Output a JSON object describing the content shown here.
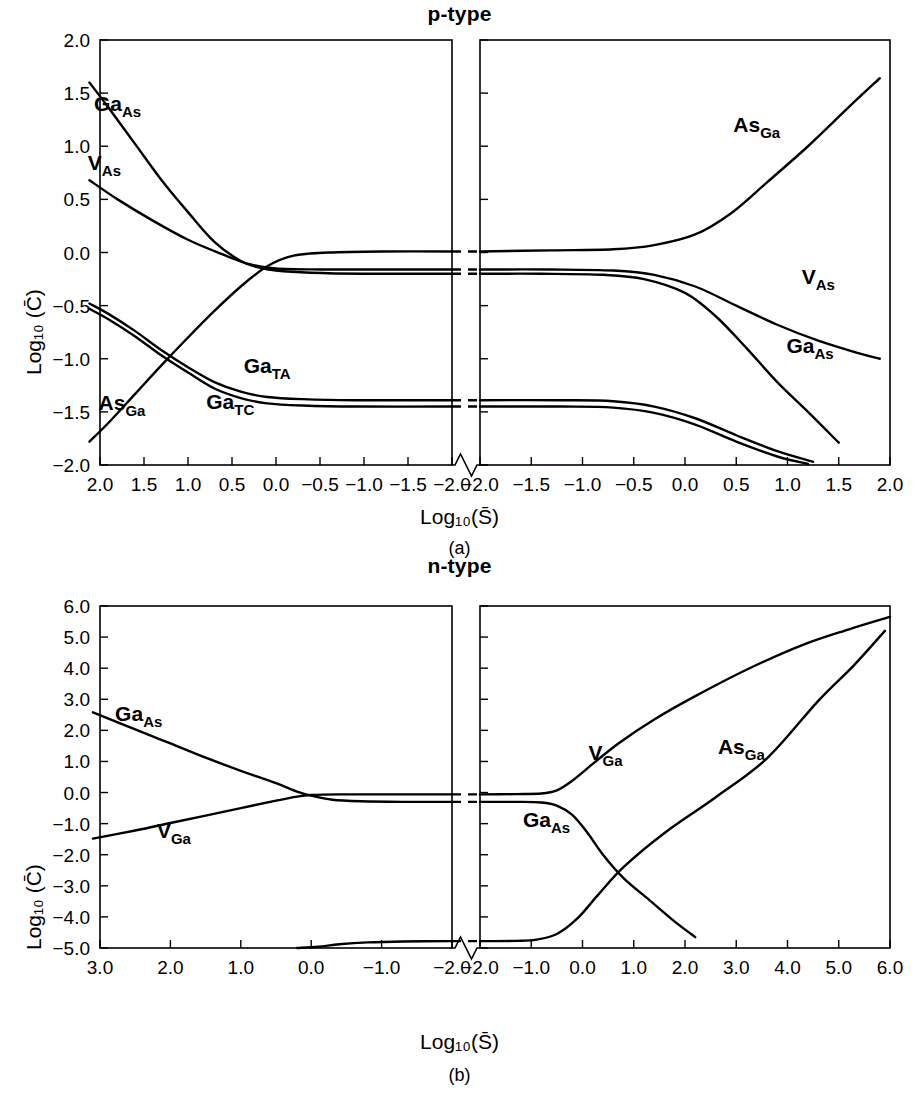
{
  "figure": {
    "panels": [
      {
        "id": "a",
        "title": "p-type",
        "caption": "(a)",
        "xlabel": "Log₁₀(S̄)",
        "ylabel": "Log₁₀ (C̄)"
      },
      {
        "id": "b",
        "title": "n-type",
        "caption": "(b)",
        "xlabel": "Log₁₀(S̄)",
        "ylabel": "Log₁₀ (C̄)"
      }
    ]
  },
  "chart_data": [
    {
      "type": "line",
      "title": "p-type",
      "caption": "(a)",
      "xlabel": "Log10(S-bar)",
      "ylabel": "Log10 (C-bar)",
      "grid": false,
      "legend": "inline-curve-labels",
      "axis_break": true,
      "left_panel": {
        "xlim": [
          2.0,
          -2.0
        ],
        "xticks": [
          2.0,
          1.5,
          1.0,
          0.5,
          0.0,
          -0.5,
          -1.0,
          -1.5,
          -2.0
        ],
        "xticklabels": [
          "2.0",
          "1.5",
          "1.0",
          "0.5",
          "0.0",
          "−0.5",
          "−1.0",
          "−1.5",
          "−2.0"
        ]
      },
      "right_panel": {
        "xlim": [
          -2.0,
          2.0
        ],
        "xticks": [
          -2.0,
          -1.5,
          -1.0,
          -0.5,
          0.0,
          0.5,
          1.0,
          1.5,
          2.0
        ],
        "xticklabels": [
          "−2.0",
          "−1.5",
          "−1.0",
          "−0.5",
          "0.0",
          "0.5",
          "1.0",
          "1.5",
          "2.0"
        ]
      },
      "ylim": [
        -2.0,
        2.0
      ],
      "yticks": [
        2.0,
        1.5,
        1.0,
        0.5,
        0.0,
        -0.5,
        -1.0,
        -1.5,
        -2.0
      ],
      "yticklabels": [
        "2.0",
        "1.5",
        "1.0",
        "0.5",
        "0.0",
        "−0.5",
        "−1.0",
        "−1.5",
        "−2.0"
      ],
      "series": [
        {
          "name": "Ga_As",
          "label_base": "Ga",
          "label_sub": "As",
          "left_points": [
            [
              2.12,
              1.6
            ],
            [
              1.9,
              1.36
            ],
            [
              1.6,
              1.02
            ],
            [
              1.3,
              0.68
            ],
            [
              1.0,
              0.38
            ],
            [
              0.7,
              0.1
            ],
            [
              0.4,
              -0.08
            ],
            [
              0.2,
              -0.14
            ],
            [
              0.0,
              -0.17
            ],
            [
              -0.4,
              -0.19
            ],
            [
              -1.0,
              -0.2
            ],
            [
              -1.6,
              -0.2
            ],
            [
              -2.0,
              -0.2
            ]
          ],
          "right_points": [
            [
              -2.0,
              -0.2
            ],
            [
              -1.4,
              -0.2
            ],
            [
              -0.8,
              -0.21
            ],
            [
              -0.4,
              -0.25
            ],
            [
              0.0,
              -0.38
            ],
            [
              0.3,
              -0.6
            ],
            [
              0.6,
              -0.9
            ],
            [
              0.9,
              -1.22
            ],
            [
              1.2,
              -1.5
            ],
            [
              1.5,
              -1.79
            ]
          ]
        },
        {
          "name": "V_As",
          "label_base": "V",
          "label_sub": "As",
          "left_points": [
            [
              2.12,
              0.68
            ],
            [
              1.8,
              0.5
            ],
            [
              1.4,
              0.3
            ],
            [
              1.0,
              0.12
            ],
            [
              0.6,
              -0.02
            ],
            [
              0.3,
              -0.11
            ],
            [
              0.0,
              -0.15
            ],
            [
              -0.5,
              -0.16
            ],
            [
              -1.1,
              -0.16
            ],
            [
              -1.6,
              -0.16
            ],
            [
              -2.0,
              -0.16
            ]
          ],
          "right_points": [
            [
              -2.0,
              -0.16
            ],
            [
              -1.3,
              -0.16
            ],
            [
              -0.7,
              -0.17
            ],
            [
              -0.3,
              -0.21
            ],
            [
              0.1,
              -0.32
            ],
            [
              0.5,
              -0.5
            ],
            [
              0.9,
              -0.68
            ],
            [
              1.3,
              -0.83
            ],
            [
              1.7,
              -0.95
            ],
            [
              1.9,
              -1.0
            ]
          ]
        },
        {
          "name": "As_Ga",
          "label_base": "As",
          "label_sub": "Ga",
          "left_points": [
            [
              2.12,
              -1.78
            ],
            [
              1.9,
              -1.6
            ],
            [
              1.6,
              -1.33
            ],
            [
              1.3,
              -1.06
            ],
            [
              1.0,
              -0.8
            ],
            [
              0.7,
              -0.55
            ],
            [
              0.4,
              -0.32
            ],
            [
              0.1,
              -0.13
            ],
            [
              -0.2,
              -0.03
            ],
            [
              -0.6,
              0.0
            ],
            [
              -1.2,
              0.01
            ],
            [
              -2.0,
              0.01
            ]
          ],
          "right_points": [
            [
              -2.0,
              0.01
            ],
            [
              -1.3,
              0.02
            ],
            [
              -0.7,
              0.03
            ],
            [
              -0.3,
              0.07
            ],
            [
              0.1,
              0.17
            ],
            [
              0.45,
              0.37
            ],
            [
              0.8,
              0.66
            ],
            [
              1.2,
              1.0
            ],
            [
              1.6,
              1.37
            ],
            [
              1.9,
              1.64
            ]
          ]
        },
        {
          "name": "Ga_TA",
          "label_base": "Ga",
          "label_sub": "TA",
          "left_points": [
            [
              2.12,
              -0.48
            ],
            [
              1.9,
              -0.58
            ],
            [
              1.6,
              -0.74
            ],
            [
              1.3,
              -0.92
            ],
            [
              1.0,
              -1.08
            ],
            [
              0.7,
              -1.22
            ],
            [
              0.4,
              -1.31
            ],
            [
              0.1,
              -1.36
            ],
            [
              -0.3,
              -1.38
            ],
            [
              -0.9,
              -1.39
            ],
            [
              -2.0,
              -1.39
            ]
          ],
          "right_points": [
            [
              -2.0,
              -1.39
            ],
            [
              -1.2,
              -1.39
            ],
            [
              -0.7,
              -1.4
            ],
            [
              -0.3,
              -1.45
            ],
            [
              0.1,
              -1.56
            ],
            [
              0.5,
              -1.72
            ],
            [
              0.9,
              -1.87
            ],
            [
              1.25,
              -1.97
            ]
          ]
        },
        {
          "name": "Ga_TC",
          "label_base": "Ga",
          "label_sub": "TC",
          "left_points": [
            [
              2.12,
              -0.53
            ],
            [
              1.9,
              -0.63
            ],
            [
              1.6,
              -0.79
            ],
            [
              1.3,
              -0.97
            ],
            [
              1.0,
              -1.13
            ],
            [
              0.7,
              -1.28
            ],
            [
              0.4,
              -1.37
            ],
            [
              0.1,
              -1.42
            ],
            [
              -0.3,
              -1.44
            ],
            [
              -0.9,
              -1.45
            ],
            [
              -2.0,
              -1.45
            ]
          ],
          "right_points": [
            [
              -2.0,
              -1.45
            ],
            [
              -1.2,
              -1.45
            ],
            [
              -0.7,
              -1.46
            ],
            [
              -0.3,
              -1.51
            ],
            [
              0.1,
              -1.62
            ],
            [
              0.5,
              -1.78
            ],
            [
              0.9,
              -1.92
            ],
            [
              1.2,
              -1.99
            ]
          ]
        }
      ],
      "curve_labels": [
        {
          "base": "Ga",
          "sub": "As",
          "panel": "left",
          "x": 1.8,
          "y": 1.33
        },
        {
          "base": "V",
          "sub": "As",
          "panel": "left",
          "x": 1.95,
          "y": 0.78
        },
        {
          "base": "As",
          "sub": "Ga",
          "panel": "left",
          "x": 1.75,
          "y": -1.48
        },
        {
          "base": "Ga",
          "sub": "TA",
          "panel": "left",
          "x": 0.1,
          "y": -1.13
        },
        {
          "base": "Ga",
          "sub": "TC",
          "panel": "left",
          "x": 0.52,
          "y": -1.47
        },
        {
          "base": "As",
          "sub": "Ga",
          "panel": "right",
          "x": 0.7,
          "y": 1.13
        },
        {
          "base": "V",
          "sub": "As",
          "panel": "right",
          "x": 1.3,
          "y": -0.3
        },
        {
          "base": "Ga",
          "sub": "As",
          "panel": "right",
          "x": 1.22,
          "y": -0.95
        }
      ]
    },
    {
      "type": "line",
      "title": "n-type",
      "caption": "(b)",
      "xlabel": "Log10(S-bar)",
      "ylabel": "Log10 (C-bar)",
      "grid": false,
      "legend": "inline-curve-labels",
      "axis_break": true,
      "left_panel": {
        "xlim": [
          3.0,
          -2.0
        ],
        "xticks": [
          3.0,
          2.0,
          1.0,
          0.0,
          -1.0,
          -2.0
        ],
        "xticklabels": [
          "3.0",
          "2.0",
          "1.0",
          "0.0",
          "−1.0",
          "−2.0"
        ]
      },
      "right_panel": {
        "xlim": [
          -2.0,
          6.0
        ],
        "xticks": [
          -2.0,
          -1.0,
          0.0,
          1.0,
          2.0,
          3.0,
          4.0,
          5.0,
          6.0
        ],
        "xticklabels": [
          "−2.0",
          "−1.0",
          "0.0",
          "1.0",
          "2.0",
          "3.0",
          "4.0",
          "5.0",
          "6.0"
        ]
      },
      "ylim": [
        -5.0,
        6.0
      ],
      "yticks": [
        6.0,
        5.0,
        4.0,
        3.0,
        2.0,
        1.0,
        0.0,
        -1.0,
        -2.0,
        -3.0,
        -4.0,
        -5.0
      ],
      "yticklabels": [
        "6.0",
        "5.0",
        "4.0",
        "3.0",
        "2.0",
        "1.0",
        "0.0",
        "−1.0",
        "−2.0",
        "−3.0",
        "−4.0",
        "−5.0"
      ],
      "series": [
        {
          "name": "Ga_As",
          "label_base": "Ga",
          "label_sub": "As",
          "left_points": [
            [
              3.1,
              2.58
            ],
            [
              2.5,
              2.03
            ],
            [
              2.0,
              1.58
            ],
            [
              1.5,
              1.12
            ],
            [
              1.0,
              0.7
            ],
            [
              0.5,
              0.3
            ],
            [
              0.2,
              0.03
            ],
            [
              0.0,
              -0.1
            ],
            [
              -0.3,
              -0.23
            ],
            [
              -0.7,
              -0.28
            ],
            [
              -1.3,
              -0.3
            ],
            [
              -2.0,
              -0.3
            ]
          ],
          "right_points": [
            [
              -2.0,
              -0.3
            ],
            [
              -1.3,
              -0.3
            ],
            [
              -0.8,
              -0.32
            ],
            [
              -0.5,
              -0.42
            ],
            [
              -0.2,
              -0.72
            ],
            [
              0.1,
              -1.3
            ],
            [
              0.4,
              -2.0
            ],
            [
              0.8,
              -2.75
            ],
            [
              1.3,
              -3.45
            ],
            [
              1.8,
              -4.15
            ],
            [
              2.2,
              -4.65
            ]
          ]
        },
        {
          "name": "V_Ga",
          "label_base": "V",
          "label_sub": "Ga",
          "left_points": [
            [
              3.1,
              -1.48
            ],
            [
              2.5,
              -1.22
            ],
            [
              2.0,
              -0.98
            ],
            [
              1.5,
              -0.74
            ],
            [
              1.0,
              -0.5
            ],
            [
              0.5,
              -0.26
            ],
            [
              0.2,
              -0.13
            ],
            [
              0.0,
              -0.08
            ],
            [
              -0.4,
              -0.06
            ],
            [
              -1.0,
              -0.06
            ],
            [
              -2.0,
              -0.06
            ]
          ],
          "right_points": [
            [
              -2.0,
              -0.06
            ],
            [
              -1.3,
              -0.05
            ],
            [
              -0.8,
              -0.03
            ],
            [
              -0.5,
              0.07
            ],
            [
              -0.2,
              0.38
            ],
            [
              0.2,
              0.92
            ],
            [
              0.7,
              1.58
            ],
            [
              1.4,
              2.35
            ],
            [
              2.2,
              3.1
            ],
            [
              3.2,
              3.95
            ],
            [
              4.3,
              4.75
            ],
            [
              5.2,
              5.25
            ],
            [
              6.0,
              5.65
            ]
          ]
        },
        {
          "name": "As_Ga",
          "label_base": "As",
          "label_sub": "Ga",
          "left_points": [
            [
              0.2,
              -5.0
            ],
            [
              -0.1,
              -4.96
            ],
            [
              -0.4,
              -4.88
            ],
            [
              -0.8,
              -4.82
            ],
            [
              -1.3,
              -4.79
            ],
            [
              -2.0,
              -4.78
            ]
          ],
          "right_points": [
            [
              -2.0,
              -4.78
            ],
            [
              -1.3,
              -4.77
            ],
            [
              -0.9,
              -4.73
            ],
            [
              -0.5,
              -4.55
            ],
            [
              -0.1,
              -4.05
            ],
            [
              0.3,
              -3.3
            ],
            [
              0.8,
              -2.4
            ],
            [
              1.6,
              -1.3
            ],
            [
              2.6,
              -0.15
            ],
            [
              3.6,
              1.1
            ],
            [
              4.6,
              2.95
            ],
            [
              5.3,
              4.1
            ],
            [
              5.9,
              5.2
            ]
          ]
        }
      ],
      "curve_labels": [
        {
          "base": "Ga",
          "sub": "As",
          "panel": "left",
          "x": 2.45,
          "y": 2.3
        },
        {
          "base": "V",
          "sub": "Ga",
          "panel": "left",
          "x": 1.95,
          "y": -1.45
        },
        {
          "base": "V",
          "sub": "Ga",
          "panel": "right",
          "x": 0.45,
          "y": 1.05
        },
        {
          "base": "Ga",
          "sub": "As",
          "panel": "right",
          "x": -0.7,
          "y": -1.1
        },
        {
          "base": "As",
          "sub": "Ga",
          "panel": "right",
          "x": 3.1,
          "y": 1.25
        }
      ]
    }
  ]
}
